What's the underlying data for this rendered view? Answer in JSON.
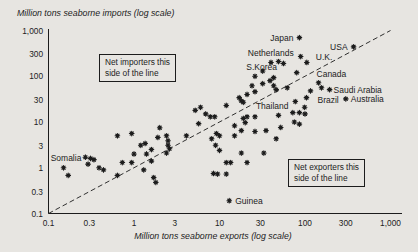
{
  "colors": {
    "background": "#e7e5e1",
    "ink": "#1c1c1c"
  },
  "annotations": {
    "net_importers": {
      "line1": "Net importers this",
      "line2": "side of the line"
    },
    "net_exporters": {
      "line1": "Net exporters this",
      "line2": "side of the line"
    }
  },
  "chart_data": {
    "type": "scatter",
    "title": "",
    "xlabel": "Million tons seaborne exports (log scale)",
    "ylabel": "Million tons seaborne imports (log scale)",
    "x_scale": "log",
    "y_scale": "log",
    "xlim": [
      0.1,
      1000
    ],
    "ylim": [
      0.1,
      1000
    ],
    "grid": false,
    "identity_line": {
      "shown": true,
      "style": "dashed",
      "from": [
        0.1,
        0.1
      ],
      "to": [
        1000,
        1000
      ]
    },
    "x_ticks": [
      {
        "label": "0.1",
        "value": 0.1
      },
      {
        "label": "0.3",
        "value": 0.3
      },
      {
        "label": "1",
        "value": 1
      },
      {
        "label": "3",
        "value": 3
      },
      {
        "label": "10",
        "value": 10
      },
      {
        "label": "30",
        "value": 30
      },
      {
        "label": "100",
        "value": 100
      },
      {
        "label": "300",
        "value": 300
      },
      {
        "label": "1,000",
        "value": 1000
      }
    ],
    "y_ticks": [
      {
        "label": "1,000",
        "value": 1000
      },
      {
        "label": "300",
        "value": 300
      },
      {
        "label": "100",
        "value": 100
      },
      {
        "label": "30",
        "value": 30
      },
      {
        "label": "10",
        "value": 10
      },
      {
        "label": "3",
        "value": 3
      },
      {
        "label": "1",
        "value": 1
      },
      {
        "label": "0.3",
        "value": 0.3
      },
      {
        "label": "0.1",
        "value": 0.1
      }
    ],
    "labeled_points": [
      {
        "name": "Japan",
        "x": 86,
        "y": 700,
        "anchor": "end",
        "dx": -6,
        "dy": 3
      },
      {
        "name": "Netherlands",
        "x": 89,
        "y": 270,
        "anchor": "end",
        "dx": -7,
        "dy": -1
      },
      {
        "name": "S.Korea",
        "x": 40,
        "y": 200,
        "anchor": "end",
        "dx": 6,
        "dy": 8
      },
      {
        "name": "USA",
        "x": 370,
        "y": 440,
        "anchor": "end",
        "dx": -6,
        "dy": 3
      },
      {
        "name": "U.K.",
        "x": 105,
        "y": 200,
        "anchor": "start",
        "dx": 9,
        "dy": -2
      },
      {
        "name": "Canada",
        "x": 144,
        "y": 72,
        "anchor": "start",
        "dx": -2,
        "dy": -6
      },
      {
        "name": "Saudi Arabia",
        "x": 194,
        "y": 51,
        "anchor": "start",
        "dx": 4,
        "dy": 3
      },
      {
        "name": "Brazil",
        "x": 156,
        "y": 56,
        "anchor": "start",
        "dx": -4,
        "dy": 15
      },
      {
        "name": "Australia",
        "x": 300,
        "y": 32,
        "anchor": "start",
        "dx": 5,
        "dy": 3
      },
      {
        "name": "Thailand",
        "x": 49,
        "y": 14,
        "anchor": "end",
        "dx": 10,
        "dy": -6
      },
      {
        "name": "Somalia",
        "x": 0.27,
        "y": 1.7,
        "anchor": "end",
        "dx": -4,
        "dy": 4
      },
      {
        "name": "Guinea",
        "x": 13,
        "y": 0.19,
        "anchor": "start",
        "dx": 6,
        "dy": 3
      }
    ],
    "points": [
      [
        0.64,
        5.0
      ],
      [
        0.94,
        5.6
      ],
      [
        2.0,
        7.5
      ],
      [
        2.4,
        5.0
      ],
      [
        1.9,
        4.6
      ],
      [
        2.5,
        3.9
      ],
      [
        1.2,
        3.1
      ],
      [
        1.35,
        3.4
      ],
      [
        1.6,
        2.5
      ],
      [
        2.5,
        3.1
      ],
      [
        2.6,
        2.6
      ],
      [
        2.4,
        2.1
      ],
      [
        1.0,
        2.0
      ],
      [
        1.4,
        2.0
      ],
      [
        0.73,
        1.3
      ],
      [
        0.94,
        1.3
      ],
      [
        1.6,
        1.4
      ],
      [
        0.31,
        1.6
      ],
      [
        0.34,
        1.5
      ],
      [
        0.29,
        1.2
      ],
      [
        0.15,
        1.0
      ],
      [
        0.39,
        1.0
      ],
      [
        0.44,
        0.9
      ],
      [
        0.17,
        0.68
      ],
      [
        0.64,
        0.68
      ],
      [
        1.3,
        0.9
      ],
      [
        1.7,
        0.61
      ],
      [
        1.8,
        0.48
      ],
      [
        5.7,
        9.2
      ],
      [
        4.1,
        5.0
      ],
      [
        8.1,
        4.3
      ],
      [
        9.2,
        5.6
      ],
      [
        10,
        5.0
      ],
      [
        9.0,
        3.1
      ],
      [
        10,
        2.4
      ],
      [
        15,
        8.3
      ],
      [
        20,
        9.7
      ],
      [
        15,
        5.0
      ],
      [
        18,
        2.1
      ],
      [
        12,
        1.3
      ],
      [
        13.5,
        1.3
      ],
      [
        21,
        1.3
      ],
      [
        8.5,
        0.75
      ],
      [
        9.5,
        0.73
      ],
      [
        12,
        0.73
      ],
      [
        35,
        6.5
      ],
      [
        52,
        7.6
      ],
      [
        46,
        4.3
      ],
      [
        33,
        2.1
      ],
      [
        26,
        13
      ],
      [
        19,
        12
      ],
      [
        26,
        6.2
      ],
      [
        18,
        6.5
      ],
      [
        19,
        27
      ],
      [
        21,
        40
      ],
      [
        17,
        34
      ],
      [
        18,
        29
      ],
      [
        12,
        23
      ],
      [
        6.0,
        21
      ],
      [
        5.2,
        18
      ],
      [
        6.9,
        15
      ],
      [
        7.8,
        13
      ],
      [
        8.8,
        13
      ],
      [
        21,
        13
      ],
      [
        24,
        62
      ],
      [
        26,
        46
      ],
      [
        46,
        51
      ],
      [
        49,
        210
      ],
      [
        56,
        190
      ],
      [
        39,
        80
      ],
      [
        43,
        93
      ],
      [
        32,
        130
      ],
      [
        26,
        100
      ],
      [
        62,
        56
      ],
      [
        43,
        62
      ],
      [
        32,
        69
      ],
      [
        80,
        120
      ],
      [
        116,
        48
      ],
      [
        104,
        34
      ],
      [
        77,
        28
      ],
      [
        99,
        21
      ],
      [
        72,
        16
      ],
      [
        86,
        16
      ],
      [
        100,
        15
      ],
      [
        75,
        10
      ],
      [
        86,
        9
      ]
    ]
  }
}
